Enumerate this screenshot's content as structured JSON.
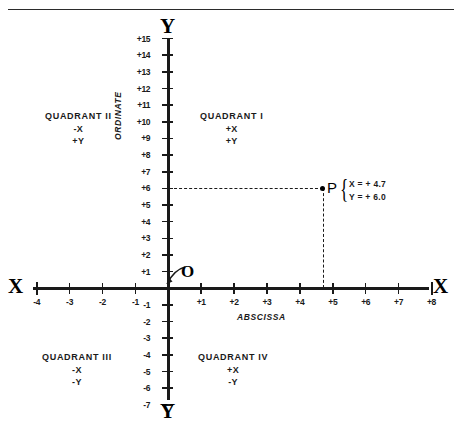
{
  "figure": {
    "axis_labels": {
      "y_top": "Y",
      "y_bottom": "Y",
      "x_left": "X",
      "x_right": "X",
      "ordinate": "ORDINATE",
      "abscissa": "ABSCISSA",
      "origin": "O"
    },
    "y_ticks": [
      "+15",
      "+14",
      "+13",
      "+12",
      "+11",
      "+10",
      "+9",
      "+8",
      "+7",
      "+6",
      "+5",
      "+4",
      "+3",
      "+2",
      "+1",
      "-1",
      "-2",
      "-3",
      "-4",
      "-5",
      "-6",
      "-7"
    ],
    "x_ticks": [
      "-4",
      "-3",
      "-2",
      "-1",
      "+1",
      "+2",
      "+3",
      "+4",
      "+5",
      "+6",
      "+7",
      "+8"
    ],
    "quadrants": [
      {
        "name": "QUADRANT I",
        "x_sign": "+X",
        "y_sign": "+Y"
      },
      {
        "name": "QUADRANT II",
        "x_sign": "-X",
        "y_sign": "+Y"
      },
      {
        "name": "QUADRANT III",
        "x_sign": "-X",
        "y_sign": "-Y"
      },
      {
        "name": "QUADRANT IV",
        "x_sign": "+X",
        "y_sign": "-Y"
      }
    ],
    "point": {
      "label": "P",
      "brace": "{",
      "x_text": "X = + 4.7",
      "y_text": "Y = + 6.0"
    },
    "colors": {
      "ink": "#1a1a1a",
      "background": "#ffffff"
    }
  },
  "chart_data": {
    "type": "scatter",
    "title": "",
    "xlabel": "ABSCISSA",
    "ylabel": "ORDINATE",
    "xlim": [
      -4,
      8
    ],
    "ylim": [
      -7,
      15
    ],
    "grid": false,
    "legend": null,
    "x_tick_values": [
      -4,
      -3,
      -2,
      -1,
      1,
      2,
      3,
      4,
      5,
      6,
      7,
      8
    ],
    "y_tick_values": [
      15,
      14,
      13,
      12,
      11,
      10,
      9,
      8,
      7,
      6,
      5,
      4,
      3,
      2,
      1,
      -1,
      -2,
      -3,
      -4,
      -5,
      -6,
      -7
    ],
    "points": [
      {
        "label": "P",
        "x": 4.7,
        "y": 6.0
      },
      {
        "label": "O",
        "x": 0,
        "y": 0
      }
    ],
    "annotations": [
      "QUADRANT I +X +Y",
      "QUADRANT II -X +Y",
      "QUADRANT III -X -Y",
      "QUADRANT IV +X -Y",
      "X = + 4.7",
      "Y = + 6.0"
    ]
  }
}
